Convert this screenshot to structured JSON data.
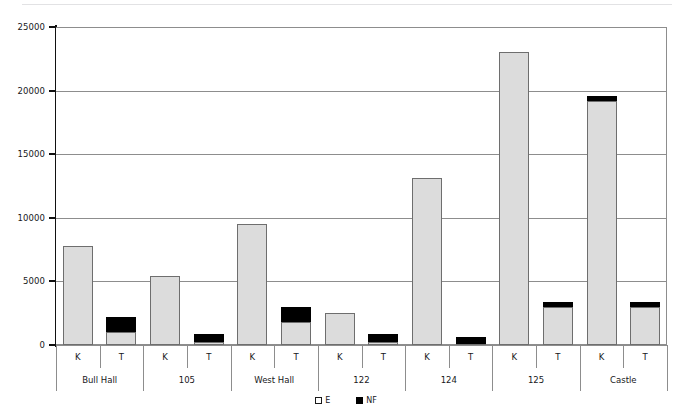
{
  "chart_data": {
    "type": "bar",
    "subtype": "stacked-grouped-column",
    "title": "",
    "subtitle": "",
    "xlabel": "",
    "ylabel": "",
    "ylim": [
      0,
      25000
    ],
    "ytick_labels": [
      "0",
      "5000",
      "10000",
      "15000",
      "20000",
      "25000"
    ],
    "ytick_values": [
      0,
      5000,
      10000,
      15000,
      20000,
      25000
    ],
    "grid": true,
    "grid_axis": "y",
    "legend_position": "bottom-center",
    "groups": [
      "Bull Hall",
      "105",
      "West Hall",
      "122",
      "124",
      "125",
      "Castle"
    ],
    "subcategories": [
      "K",
      "T"
    ],
    "categories": [
      "Bull Hall K",
      "Bull Hall T",
      "105 K",
      "105 T",
      "West Hall K",
      "West Hall T",
      "122 K",
      "122 T",
      "124 K",
      "124 T",
      "125 K",
      "125 T",
      "Castle K",
      "Castle T"
    ],
    "series": [
      {
        "name": "E",
        "color": "#dcdcdc",
        "values": [
          7800,
          1000,
          5400,
          200,
          9500,
          1800,
          2500,
          250,
          13100,
          100,
          23000,
          3000,
          19200,
          3000
        ]
      },
      {
        "name": "NF",
        "color": "#000000",
        "values": [
          0,
          1200,
          0,
          700,
          0,
          1200,
          0,
          650,
          0,
          500,
          0,
          400,
          400,
          400
        ]
      }
    ],
    "totals": [
      7800,
      2200,
      5400,
      900,
      9500,
      3000,
      2500,
      900,
      13100,
      600,
      23000,
      3400,
      19600,
      3400
    ]
  },
  "legend": {
    "items": [
      {
        "label": "E",
        "swatch": "legend-swatch-e"
      },
      {
        "label": "NF",
        "swatch": "legend-swatch-nf"
      }
    ]
  },
  "axis": {
    "y": {
      "ticks": [
        {
          "label": "25000",
          "value": 25000
        },
        {
          "label": "20000",
          "value": 20000
        },
        {
          "label": "15000",
          "value": 15000
        },
        {
          "label": "10000",
          "value": 10000
        },
        {
          "label": "5000",
          "value": 5000
        },
        {
          "label": "0",
          "value": 0
        }
      ]
    },
    "x": {
      "sub_labels": [
        "K",
        "T",
        "K",
        "T",
        "K",
        "T",
        "K",
        "T",
        "K",
        "T",
        "K",
        "T",
        "K",
        "T"
      ],
      "group_labels": [
        "Bull Hall",
        "105",
        "West Hall",
        "122",
        "124",
        "125",
        "Castle"
      ]
    }
  },
  "colors": {
    "series_e": "#dcdcdc",
    "series_nf": "#000000",
    "grid": "#8d8d8d",
    "axis": "#111111",
    "text": "#17171a",
    "background": "#ffffff"
  }
}
